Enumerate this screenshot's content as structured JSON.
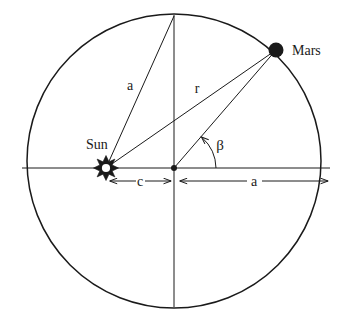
{
  "diagram": {
    "background_color": "#ffffff",
    "stroke_color": "#1a1a1a",
    "labels": {
      "sun": "Sun",
      "mars": "Mars",
      "semi_major_upper": "a",
      "radius_vector": "r",
      "eccentric_distance": "c",
      "semi_major_right": "a",
      "angle_beta": "β"
    },
    "geometry": {
      "circle": {
        "cx": 174,
        "cy": 161,
        "r": 147
      },
      "center_point": {
        "x": 174,
        "y": 168
      },
      "sun_point": {
        "x": 106,
        "y": 168
      },
      "mars_point": {
        "x": 276,
        "y": 50
      },
      "top_point": {
        "x": 174,
        "y": 16
      },
      "horizontal_axis": {
        "x1": 22,
        "y1": 168,
        "x2": 330,
        "y2": 168
      },
      "vertical_axis": {
        "x1": 174,
        "y1": 16,
        "x2": 174,
        "y2": 307
      },
      "dimension_c": {
        "from_x": 110,
        "to_x": 170,
        "y": 181
      },
      "dimension_a": {
        "from_x": 180,
        "to_x": 328,
        "y": 181
      },
      "beta_arc_radius": 42
    },
    "label_positions": {
      "sun": {
        "x": 86,
        "y": 149
      },
      "mars": {
        "x": 292,
        "y": 54
      },
      "semi_major_upper": {
        "x": 130,
        "y": 90
      },
      "radius_vector": {
        "x": 196,
        "y": 92
      },
      "angle_beta": {
        "x": 219,
        "y": 149
      },
      "eccentric_distance": {
        "x": 140,
        "y": 186
      },
      "semi_major_right": {
        "x": 254,
        "y": 186
      }
    }
  }
}
